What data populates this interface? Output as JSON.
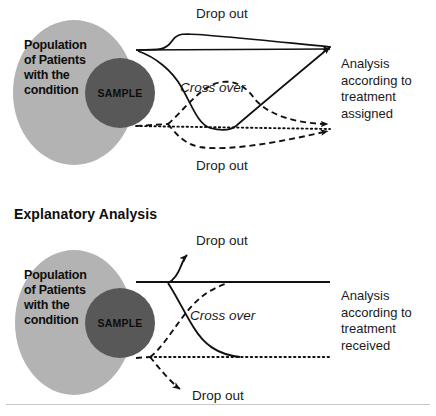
{
  "figure": {
    "title_visible": false,
    "background_color": "#ffffff",
    "colors": {
      "population_circle": "#b3b3b3",
      "sample_circle": "#585858",
      "stroke": "#111111",
      "text": "#1a1a1a",
      "rule": "#c9c9c9"
    }
  },
  "panels": [
    {
      "id": "pragmatic",
      "heading": "",
      "venn": {
        "population_label": "Population\nof Patients\nwith the\ncondition",
        "sample_label": "SAMPLE"
      },
      "labels": {
        "dropout_top": "Drop out",
        "crossover": "Cross over",
        "dropout_bottom": "Drop out"
      },
      "outcome": "Analysis\n according to\n treatment\n assigned"
    },
    {
      "id": "explanatory",
      "heading": "Explanatory Analysis",
      "venn": {
        "population_label": "Population\nof Patients\nwith the\ncondition",
        "sample_label": "SAMPLE"
      },
      "labels": {
        "dropout_top": "Drop out",
        "crossover": "Cross over",
        "dropout_bottom": "Drop out"
      },
      "outcome": "Analysis\n according to\n treatment\n received"
    }
  ]
}
